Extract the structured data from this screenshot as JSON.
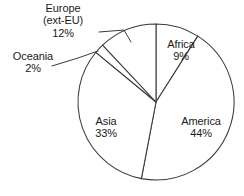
{
  "chart_data": {
    "type": "pie",
    "title": "",
    "subtitle": "",
    "xlabel": "",
    "ylabel": "",
    "legend_position": "none",
    "grid": false,
    "units": "percent",
    "start_angle_deg": 0,
    "direction": "clockwise",
    "categories": [
      "Africa",
      "America",
      "Asia",
      "Oceania",
      "Europe (ext-EU)"
    ],
    "values": [
      9,
      44,
      33,
      2,
      12
    ],
    "slices": [
      {
        "name": "Africa",
        "name_line1": "Africa",
        "name_line2": "",
        "value": 9,
        "percent_label": "9%",
        "label_placement": "inside",
        "color": "#ffffff",
        "start_deg": 0,
        "end_deg": 32.4
      },
      {
        "name": "America",
        "name_line1": "America",
        "name_line2": "",
        "value": 44,
        "percent_label": "44%",
        "label_placement": "inside",
        "color": "#ffffff",
        "start_deg": 32.4,
        "end_deg": 190.8
      },
      {
        "name": "Asia",
        "name_line1": "Asia",
        "name_line2": "",
        "value": 33,
        "percent_label": "33%",
        "label_placement": "inside",
        "color": "#ffffff",
        "start_deg": 190.8,
        "end_deg": 309.6
      },
      {
        "name": "Oceania",
        "name_line1": "Oceania",
        "name_line2": "",
        "value": 2,
        "percent_label": "2%",
        "label_placement": "outside-leader",
        "color": "#ffffff",
        "start_deg": 309.6,
        "end_deg": 316.8
      },
      {
        "name": "Europe (ext-EU)",
        "name_line1": "Europe",
        "name_line2": "(ext-EU)",
        "value": 12,
        "percent_label": "12%",
        "label_placement": "outside-leader",
        "color": "#ffffff",
        "start_deg": 316.8,
        "end_deg": 360
      }
    ],
    "style": {
      "stroke": "#3a3a3a",
      "fill": "#ffffff",
      "background": "#ffffff"
    }
  }
}
